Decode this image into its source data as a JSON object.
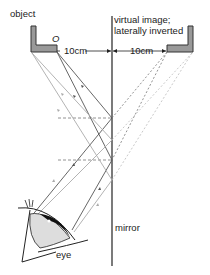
{
  "labels": {
    "object": "object",
    "object_point": "O",
    "distance_left": "10cm",
    "distance_right": "10cm",
    "virtual_image_line1": "virtual image;",
    "virtual_image_line2": "laterally inverted",
    "mirror": "mirror",
    "eye": "eye"
  },
  "colors": {
    "mirror": "#333333",
    "ray_dark": "#555555",
    "ray_light": "#aaaaaa",
    "object_fill": "#999999",
    "dashed": "#777777"
  }
}
